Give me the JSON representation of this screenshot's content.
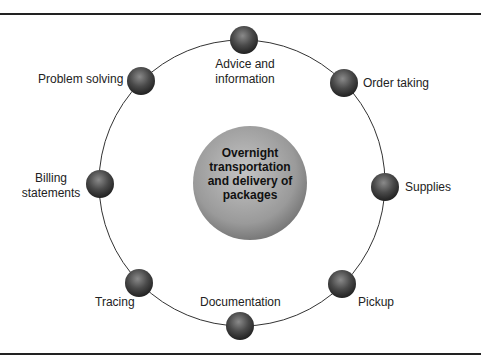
{
  "diagram": {
    "center": "Overnight transportation and delivery of packages",
    "center_lines": [
      "Overnight",
      "transportation",
      "and delivery of",
      "packages"
    ],
    "nodes": [
      {
        "label": "Advice and information",
        "lines": [
          "Advice and",
          "information"
        ]
      },
      {
        "label": "Order taking"
      },
      {
        "label": "Supplies"
      },
      {
        "label": "Pickup"
      },
      {
        "label": "Documentation"
      },
      {
        "label": "Tracing"
      },
      {
        "label": "Billing statements",
        "lines": [
          "Billing",
          "statements"
        ]
      },
      {
        "label": "Problem solving"
      }
    ],
    "colors": {
      "ball": "#4a4a4a",
      "center": "#9a9a9a",
      "ring": "#333333",
      "rule": "#222222"
    }
  }
}
